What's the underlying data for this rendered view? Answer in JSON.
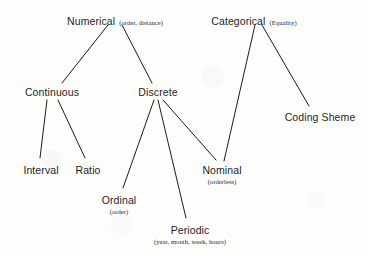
{
  "diagram": {
    "type": "tree",
    "background_color": "#fdfdfc",
    "line_color": "#1a1a1a",
    "text_color": "#1d1d1d",
    "nodes": [
      {
        "id": "numerical",
        "label": "Numerical",
        "annotation": "(order, distance)",
        "annotation_position": "inline",
        "x": 115,
        "y": 11,
        "level": 0
      },
      {
        "id": "categorical",
        "label": "Categorical",
        "annotation": "(Equality)",
        "annotation_position": "inline",
        "x": 254,
        "y": 11,
        "level": 0
      },
      {
        "id": "continuous",
        "label": "Continuous",
        "annotation": "",
        "annotation_position": "none",
        "x": 52,
        "y": 86,
        "level": 1
      },
      {
        "id": "discrete",
        "label": "Discrete",
        "annotation": "",
        "annotation_position": "none",
        "x": 158,
        "y": 86,
        "level": 1
      },
      {
        "id": "coding-sheme",
        "label": "Coding Sheme",
        "annotation": "",
        "annotation_position": "none",
        "x": 320,
        "y": 111,
        "level": 1
      },
      {
        "id": "interval",
        "label": "Interval",
        "annotation": "",
        "annotation_position": "none",
        "x": 41,
        "y": 164,
        "level": 2
      },
      {
        "id": "ratio",
        "label": "Ratio",
        "annotation": "",
        "annotation_position": "none",
        "x": 88,
        "y": 164,
        "level": 2
      },
      {
        "id": "nominal",
        "label": "Nominal",
        "annotation": "(orderless)",
        "annotation_position": "below",
        "x": 222,
        "y": 164,
        "level": 2
      },
      {
        "id": "ordinal",
        "label": "Ordinal",
        "annotation": "(order)",
        "annotation_position": "below",
        "x": 119,
        "y": 194,
        "level": 2
      },
      {
        "id": "periodic",
        "label": "Periodic",
        "annotation": "(year, month, week, hours)",
        "annotation_position": "below",
        "x": 190,
        "y": 224,
        "level": 2
      }
    ],
    "edges": [
      {
        "from": "numerical",
        "to": "continuous",
        "x1": 108,
        "y1": 25,
        "x2": 62,
        "y2": 83
      },
      {
        "from": "numerical",
        "to": "discrete",
        "x1": 122,
        "y1": 25,
        "x2": 152,
        "y2": 83
      },
      {
        "from": "categorical",
        "to": "nominal",
        "x1": 255,
        "y1": 25,
        "x2": 224,
        "y2": 161
      },
      {
        "from": "categorical",
        "to": "coding-sheme",
        "x1": 262,
        "y1": 25,
        "x2": 309,
        "y2": 106
      },
      {
        "from": "continuous",
        "to": "interval",
        "x1": 47,
        "y1": 100,
        "x2": 40,
        "y2": 158
      },
      {
        "from": "continuous",
        "to": "ratio",
        "x1": 58,
        "y1": 100,
        "x2": 85,
        "y2": 158
      },
      {
        "from": "discrete",
        "to": "ordinal",
        "x1": 154,
        "y1": 100,
        "x2": 123,
        "y2": 188
      },
      {
        "from": "discrete",
        "to": "periodic",
        "x1": 158,
        "y1": 100,
        "x2": 186,
        "y2": 218
      },
      {
        "from": "discrete",
        "to": "nominal",
        "x1": 163,
        "y1": 100,
        "x2": 216,
        "y2": 160
      }
    ]
  }
}
